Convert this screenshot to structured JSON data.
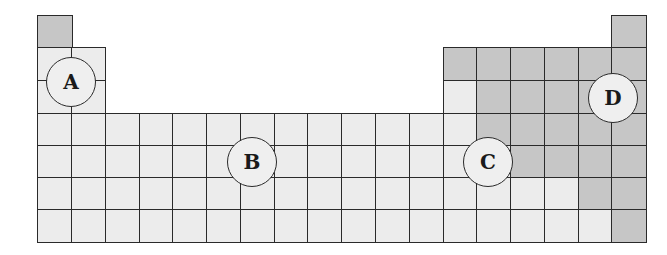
{
  "diagram": {
    "type": "periodic-table-outline",
    "columns": 18,
    "rows": 7,
    "colors": {
      "light": "#ececec",
      "gray": "#c6c6c6",
      "border": "#2a2a2a",
      "marker_fill": "#efefef"
    },
    "shading": [
      "g................g",
      "ll..........gggggg",
      "ll..........lggggg",
      "lllllllllllllggggg",
      "llllllllllllllgggg",
      "llllllllllllllllgg",
      "lllllllllllllllllg"
    ],
    "markers": [
      {
        "label": "A",
        "cx": 71,
        "cy": 82
      },
      {
        "label": "B",
        "cx": 252,
        "cy": 162
      },
      {
        "label": "C",
        "cx": 488,
        "cy": 162
      },
      {
        "label": "D",
        "cx": 613,
        "cy": 98
      }
    ]
  }
}
